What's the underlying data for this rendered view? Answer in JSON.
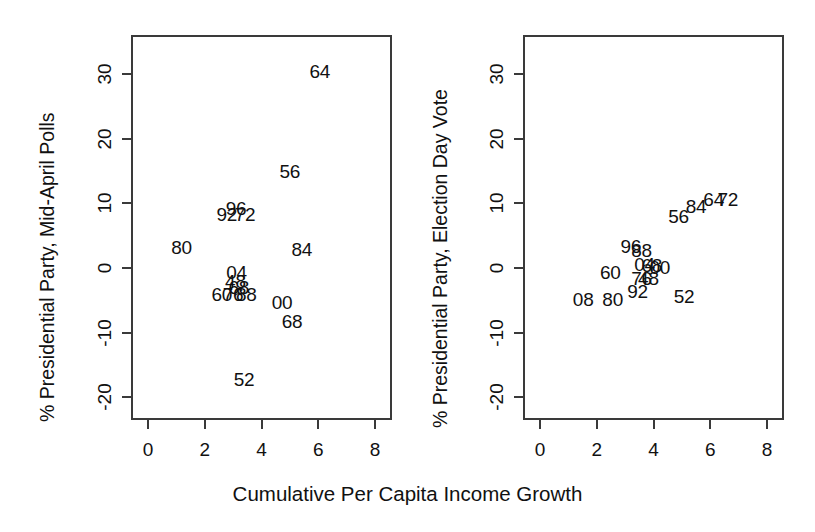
{
  "figure": {
    "background": "#ffffff",
    "foreground": "#111111",
    "frame_color": "#3a3a3a"
  },
  "xlabel": "Cumulative Per Capita Income Growth",
  "chart_data": [
    {
      "type": "scatter",
      "panel": "left",
      "title": "",
      "xlabel": "Cumulative Per Capita Income Growth",
      "ylabel": "% Presidential Party, Mid-April Polls",
      "xlim": [
        -0.6,
        8.6
      ],
      "ylim": [
        -23.5,
        36.0
      ],
      "xticks": [
        0,
        2,
        4,
        6,
        8
      ],
      "xticklabels": [
        "0",
        "2",
        "4",
        "6",
        "8"
      ],
      "yticks": [
        -20,
        -10,
        0,
        10,
        20,
        30
      ],
      "yticklabels": [
        "-20",
        "-10",
        "0",
        "10",
        "20",
        "30"
      ],
      "grid": false,
      "legend": "none",
      "marker": "text-label",
      "points": [
        {
          "label": "64",
          "x": 6.05,
          "y": 30.5
        },
        {
          "label": "56",
          "x": 5.0,
          "y": 15.0
        },
        {
          "label": "92",
          "x": 2.78,
          "y": 8.4
        },
        {
          "label": "96",
          "x": 3.1,
          "y": 9.3
        },
        {
          "label": "72",
          "x": 3.42,
          "y": 8.4
        },
        {
          "label": "80",
          "x": 1.18,
          "y": 3.2
        },
        {
          "label": "84",
          "x": 5.42,
          "y": 2.9
        },
        {
          "label": "04",
          "x": 3.12,
          "y": -0.7
        },
        {
          "label": "48",
          "x": 3.08,
          "y": -2.0
        },
        {
          "label": "68",
          "x": 3.2,
          "y": -2.9
        },
        {
          "label": "60",
          "x": 2.6,
          "y": -4.0
        },
        {
          "label": "76",
          "x": 3.0,
          "y": -4.0
        },
        {
          "label": "88",
          "x": 3.46,
          "y": -4.0
        },
        {
          "label": "00",
          "x": 4.72,
          "y": -5.2
        },
        {
          "label": "68",
          "x": 5.08,
          "y": -8.2
        },
        {
          "label": "52",
          "x": 3.38,
          "y": -17.2
        }
      ]
    },
    {
      "type": "scatter",
      "panel": "right",
      "title": "",
      "xlabel": "Cumulative Per Capita Income Growth",
      "ylabel": "% Presidential Party, Election Day Vote",
      "xlim": [
        -0.6,
        8.6
      ],
      "ylim": [
        -23.5,
        36.0
      ],
      "xticks": [
        0,
        2,
        4,
        6,
        8
      ],
      "xticklabels": [
        "0",
        "2",
        "4",
        "6",
        "8"
      ],
      "yticks": [
        -20,
        -10,
        0,
        10,
        20,
        30
      ],
      "yticklabels": [
        "-20",
        "-10",
        "0",
        "10",
        "20",
        "30"
      ],
      "grid": false,
      "legend": "none",
      "marker": "text-label",
      "points": [
        {
          "label": "72",
          "x": 6.62,
          "y": 10.6
        },
        {
          "label": "64",
          "x": 6.12,
          "y": 10.6
        },
        {
          "label": "84",
          "x": 5.5,
          "y": 9.6
        },
        {
          "label": "56",
          "x": 4.88,
          "y": 8.0
        },
        {
          "label": "96",
          "x": 3.2,
          "y": 3.4
        },
        {
          "label": "88",
          "x": 3.58,
          "y": 2.7
        },
        {
          "label": "04",
          "x": 3.68,
          "y": 0.6
        },
        {
          "label": "68",
          "x": 3.94,
          "y": 0.4
        },
        {
          "label": "00",
          "x": 4.22,
          "y": 0.1
        },
        {
          "label": "60",
          "x": 2.48,
          "y": -0.6
        },
        {
          "label": "76",
          "x": 3.58,
          "y": -1.6
        },
        {
          "label": "48",
          "x": 3.82,
          "y": -1.6
        },
        {
          "label": "92",
          "x": 3.44,
          "y": -3.6
        },
        {
          "label": "52",
          "x": 5.08,
          "y": -4.3
        },
        {
          "label": "80",
          "x": 2.56,
          "y": -4.8
        },
        {
          "label": "08",
          "x": 1.52,
          "y": -4.8
        }
      ]
    }
  ]
}
